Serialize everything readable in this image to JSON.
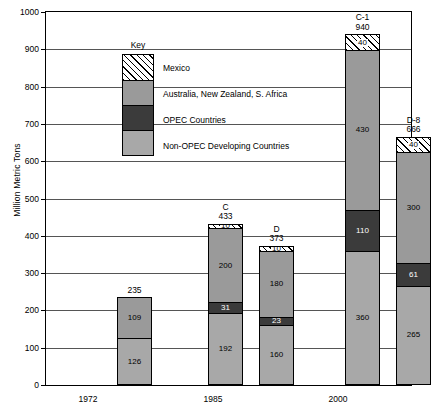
{
  "chart_data": {
    "type": "bar",
    "title": "",
    "xlabel": "",
    "ylabel": "Million Metric Tons",
    "ylim": [
      0,
      1000
    ],
    "ytick_step": 100,
    "yticks": [
      0,
      100,
      200,
      300,
      400,
      500,
      600,
      700,
      800,
      900,
      1000
    ],
    "grid": true,
    "legend_position": "inside-top-left",
    "legend_title": "Key",
    "stacked": true,
    "series": [
      {
        "name": "Non-OPEC Developing Countries",
        "color": "#a8a8a8",
        "values": [
          126,
          192,
          160,
          360,
          265
        ]
      },
      {
        "name": "OPEC Countries",
        "color": "#3b3b3b",
        "values": [
          109,
          31,
          23,
          110,
          61
        ]
      },
      {
        "name": "Australia, New Zealand, S. Africa",
        "color": "#9a9a9a",
        "values": [
          0,
          200,
          180,
          430,
          300
        ]
      },
      {
        "name": "Mexico",
        "color": "#ffffff-hatched",
        "values": [
          0,
          10,
          10,
          40,
          40
        ]
      }
    ],
    "bars": [
      {
        "id": "bar-1972",
        "name": "",
        "total": 235,
        "total_label": "235",
        "group": "1972",
        "segments": [
          {
            "series": "Australia, New Zealand, S. Africa",
            "value": 109,
            "label": "109",
            "style": "anzsa"
          },
          {
            "series": "Non-OPEC Developing Countries",
            "value": 126,
            "label": "126",
            "style": "nonopec"
          }
        ]
      },
      {
        "id": "bar-1985-c",
        "name": "C",
        "total": 433,
        "total_label": "433",
        "group": "1985",
        "segments": [
          {
            "series": "Mexico",
            "value": 10,
            "label": "10",
            "style": "mexico"
          },
          {
            "series": "Australia, New Zealand, S. Africa",
            "value": 200,
            "label": "200",
            "style": "anzsa"
          },
          {
            "series": "OPEC Countries",
            "value": 31,
            "label": "31",
            "style": "opec"
          },
          {
            "series": "Non-OPEC Developing Countries",
            "value": 192,
            "label": "192",
            "style": "nonopec"
          }
        ]
      },
      {
        "id": "bar-1985-d",
        "name": "D",
        "total": 373,
        "total_label": "373",
        "group": "1985",
        "segments": [
          {
            "series": "Mexico",
            "value": 10,
            "label": "10",
            "style": "mexico"
          },
          {
            "series": "Australia, New Zealand, S. Africa",
            "value": 180,
            "label": "180",
            "style": "anzsa"
          },
          {
            "series": "OPEC Countries",
            "value": 23,
            "label": "23",
            "style": "opec"
          },
          {
            "series": "Non-OPEC Developing Countries",
            "value": 160,
            "label": "160",
            "style": "nonopec"
          }
        ]
      },
      {
        "id": "bar-2000-c1",
        "name": "C-1",
        "total": 940,
        "total_label": "940",
        "group": "2000",
        "segments": [
          {
            "series": "Mexico",
            "value": 40,
            "label": "40",
            "style": "mexico"
          },
          {
            "series": "Australia, New Zealand, S. Africa",
            "value": 430,
            "label": "430",
            "style": "anzsa"
          },
          {
            "series": "OPEC Countries",
            "value": 110,
            "label": "110",
            "style": "opec"
          },
          {
            "series": "Non-OPEC Developing Countries",
            "value": 360,
            "label": "360",
            "style": "nonopec"
          }
        ]
      },
      {
        "id": "bar-2000-d8",
        "name": "D-8",
        "total": 666,
        "total_label": "666",
        "group": "2000",
        "segments": [
          {
            "series": "Mexico",
            "value": 40,
            "label": "40",
            "style": "mexico"
          },
          {
            "series": "Australia, New Zealand, S. Africa",
            "value": 300,
            "label": "300",
            "style": "anzsa"
          },
          {
            "series": "OPEC Countries",
            "value": 61,
            "label": "61",
            "style": "opec"
          },
          {
            "series": "Non-OPEC Developing Countries",
            "value": 265,
            "label": "265",
            "style": "nonopec"
          }
        ]
      }
    ],
    "groups": [
      {
        "label": "1972",
        "center": 88
      },
      {
        "label": "1985",
        "center": 213
      },
      {
        "label": "2000",
        "center": 338
      }
    ]
  },
  "legend": {
    "title": "Key",
    "items": [
      {
        "label": "Mexico",
        "style": "mexico"
      },
      {
        "label": "Australia, New Zealand, S. Africa",
        "style": "anzsa"
      },
      {
        "label": "OPEC Countries",
        "style": "opec"
      },
      {
        "label": "Non-OPEC Developing Countries",
        "style": "nonopec"
      }
    ]
  },
  "axis": {
    "y_title": "Million Metric Tons"
  }
}
